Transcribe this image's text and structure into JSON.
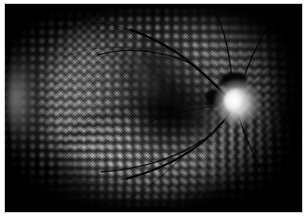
{
  "figure": {
    "kind": "retinal-fundus-photograph",
    "caption": "",
    "modality_label": "red-free monochrome wide-field fundus montage",
    "colors": {
      "background": "#ffffff",
      "plate_background": "#000000",
      "frame_border": "#cfcfcf",
      "tissue_mid": "#2e2e2e",
      "laser_scar": "#dedede",
      "optic_disc_bright": "#ffffff",
      "vessel": "#000000",
      "crescent_highlight": "#ececec"
    },
    "border": {
      "visible": true,
      "color": "#cfcfcf",
      "width_px": 1
    }
  },
  "regions": {
    "optic_disc": {
      "name": "optic-disc",
      "description": "Bright white optic nerve head",
      "position": {
        "x_pct": 77,
        "y_pct": 46
      }
    },
    "macula": {
      "name": "macula",
      "description": "Dark hypo-reflective central macular zone",
      "position": {
        "x_pct": 55,
        "y_pct": 52
      }
    },
    "crescent": {
      "name": "edge-crescent-artifact",
      "description": "Bright illumination crescent along left image margin",
      "position": {
        "x_pct": 5,
        "y_pct": 45
      }
    },
    "laser_scars": {
      "name": "prp-laser-scar-grid",
      "description": "Regular grid of pan-retinal photocoagulation burns",
      "spacing_px": 9
    },
    "vessel_tree": {
      "name": "retinal-vessel-tree",
      "description": "Dark branching arteriolar and venular arcades radiating from the optic disc"
    }
  },
  "vessels": {
    "paths": [
      {
        "id": "sup-temporal-arcade",
        "d": "M233,98 C222,86 208,72 190,58 C172,44 152,34 130,26",
        "weight": "v-main"
      },
      {
        "id": "sup-temporal-branch-1",
        "d": "M196,63 C182,54 164,50 144,48 C126,46 110,48 96,52",
        "weight": "v-mid"
      },
      {
        "id": "sup-temporal-branch-2",
        "d": "M176,50 C162,40 146,32 128,26 C112,21 98,19 84,19",
        "weight": "v-thin"
      },
      {
        "id": "sup-nasal-1",
        "d": "M237,94 C236,78 234,60 230,42 C227,28 223,18 218,10",
        "weight": "v-mid"
      },
      {
        "id": "sup-nasal-2",
        "d": "M241,94 C246,78 252,62 260,46 C266,34 272,24 278,16",
        "weight": "v-mid"
      },
      {
        "id": "sup-nasal-3",
        "d": "M246,96 C256,84 268,72 282,60 C290,54 296,50 302,46",
        "weight": "v-thin"
      },
      {
        "id": "inf-temporal-arcade",
        "d": "M234,110 C224,124 210,138 192,150 C172,163 150,172 126,178",
        "weight": "v-main"
      },
      {
        "id": "inf-temporal-branch-1",
        "d": "M206,138 C192,148 174,156 154,162 C136,167 118,170 100,171",
        "weight": "v-mid"
      },
      {
        "id": "inf-temporal-branch-2",
        "d": "M188,152 C176,164 162,176 146,188 C134,196 122,202 110,206",
        "weight": "v-thin"
      },
      {
        "id": "inf-nasal-1",
        "d": "M241,111 C246,126 252,142 260,158 C266,170 272,180 278,188",
        "weight": "v-mid"
      },
      {
        "id": "inf-nasal-2",
        "d": "M246,108 C258,118 270,128 284,140 C292,147 298,152 303,157",
        "weight": "v-thin"
      },
      {
        "id": "macular-twig",
        "d": "M230,104 C216,104 200,106 184,110 C170,113 158,117 148,121",
        "weight": "v-thin"
      },
      {
        "id": "peripheral-hair-1",
        "d": "M150,48 C134,44 116,43 98,45 C82,47 68,51 56,56",
        "weight": "v-hair"
      },
      {
        "id": "peripheral-hair-2",
        "d": "M126,178 C110,181 92,182 74,180 C60,178 48,175 38,171",
        "weight": "v-hair"
      },
      {
        "id": "peripheral-hair-3",
        "d": "M258,70 C266,62 276,54 288,46",
        "weight": "v-hair"
      },
      {
        "id": "peripheral-hair-4",
        "d": "M120,26 C106,22 90,20 74,22",
        "weight": "v-hair"
      }
    ]
  }
}
